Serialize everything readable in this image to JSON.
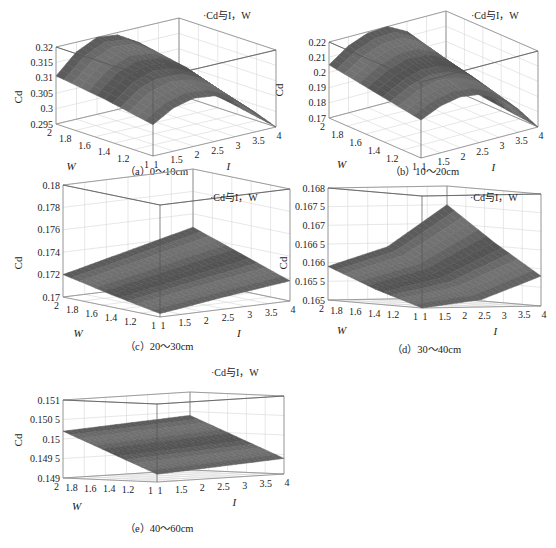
{
  "figure": {
    "background": "#ffffff",
    "surface_color": "#6e6e6e",
    "surface_edge_color": "#4a4a4a",
    "box_color": "#8a8a8a",
    "grid_color": "#d6d6d6"
  },
  "chart_data": [
    {
      "id": "a",
      "type": "surface3d",
      "caption": "（a）0～10cm",
      "legend": "·Cd与I，W",
      "xlabel": "I",
      "ylabel": "W",
      "zlabel": "Cd",
      "x_ticks": [
        "1",
        "1.5",
        "2",
        "2.5",
        "3",
        "3.5",
        "4"
      ],
      "y_ticks": [
        "1",
        "1.2",
        "1.4",
        "1.6",
        "1.8",
        "2"
      ],
      "z_ticks": [
        "0.295",
        "0.3",
        "0.305",
        "0.31",
        "0.315",
        "0.32"
      ],
      "xlim": [
        1,
        4
      ],
      "ylim": [
        1,
        2
      ],
      "zlim": [
        0.293,
        0.325
      ],
      "grid": true,
      "corners": {
        "W1I1": 0.306,
        "W2I1": 0.313,
        "W1I4": 0.293,
        "W2I4": 0.3
      },
      "peak": {
        "I": 2.2,
        "W": 2.0,
        "Cd": 0.325
      },
      "surface_grid": {
        "I": [
          1,
          1.5,
          2,
          2.5,
          3,
          3.5,
          4
        ],
        "W": [
          1,
          1.5,
          2
        ],
        "Cd": [
          [
            0.306,
            0.311,
            0.313,
            0.312,
            0.308,
            0.301,
            0.293
          ],
          [
            0.31,
            0.317,
            0.32,
            0.319,
            0.315,
            0.307,
            0.297
          ],
          [
            0.313,
            0.321,
            0.325,
            0.324,
            0.319,
            0.311,
            0.3
          ]
        ]
      }
    },
    {
      "id": "b",
      "type": "surface3d",
      "caption": "（b）10～20cm",
      "legend": "·Cd与I，W",
      "xlabel": "I",
      "ylabel": "W",
      "zlabel": "Cd",
      "x_ticks": [
        "1",
        "1.5",
        "2",
        "2.5",
        "3",
        "3.5",
        "4"
      ],
      "y_ticks": [
        "1",
        "1.2",
        "1.4",
        "1.6",
        "1.8",
        "2"
      ],
      "z_ticks": [
        "0.17",
        "0.18",
        "0.19",
        "0.2",
        "0.21",
        "0.22"
      ],
      "xlim": [
        1,
        4
      ],
      "ylim": [
        1,
        2
      ],
      "zlim": [
        0.168,
        0.228
      ],
      "grid": true,
      "corners": {
        "W1I1": 0.198,
        "W2I1": 0.21,
        "W1I4": 0.168,
        "W2I4": 0.176
      },
      "peak": {
        "I": 2.3,
        "W": 2.0,
        "Cd": 0.228
      },
      "surface_grid": {
        "I": [
          1,
          1.5,
          2,
          2.5,
          3,
          3.5,
          4
        ],
        "W": [
          1,
          1.5,
          2
        ],
        "Cd": [
          [
            0.198,
            0.205,
            0.208,
            0.206,
            0.199,
            0.186,
            0.168
          ],
          [
            0.204,
            0.213,
            0.218,
            0.217,
            0.21,
            0.196,
            0.172
          ],
          [
            0.21,
            0.221,
            0.227,
            0.228,
            0.22,
            0.202,
            0.176
          ]
        ]
      }
    },
    {
      "id": "c",
      "type": "surface3d",
      "caption": "（c）20～30cm",
      "legend": "·Cd与I，W",
      "xlabel": "I",
      "ylabel": "W",
      "zlabel": "Cd",
      "x_ticks": [
        "1",
        "1.5",
        "2",
        "2.5",
        "3",
        "3.5",
        "4"
      ],
      "y_ticks": [
        "1",
        "1.2",
        "1.4",
        "1.6",
        "1.8",
        "2"
      ],
      "z_ticks": [
        "0.17",
        "0.172",
        "0.174",
        "0.176",
        "0.178",
        "0.18"
      ],
      "xlim": [
        1,
        4
      ],
      "ylim": [
        1,
        2
      ],
      "zlim": [
        0.17,
        0.18
      ],
      "grid": true,
      "corners": {
        "W1I1": 0.1703,
        "W2I1": 0.172,
        "W1I4": 0.1718,
        "W2I4": 0.1748
      },
      "surface_grid": {
        "I": [
          1,
          2.5,
          4
        ],
        "W": [
          1,
          1.5,
          2
        ],
        "Cd": [
          [
            0.1703,
            0.1711,
            0.1718
          ],
          [
            0.1711,
            0.1722,
            0.1733
          ],
          [
            0.172,
            0.1734,
            0.1748
          ]
        ]
      }
    },
    {
      "id": "d",
      "type": "surface3d",
      "caption": "（d）30～40cm",
      "legend": "·Cd与I，W",
      "xlabel": "I",
      "ylabel": "W",
      "zlabel": "Cd",
      "x_ticks": [
        "1",
        "1.5",
        "2",
        "2.5",
        "3",
        "3.5",
        "4"
      ],
      "y_ticks": [
        "1",
        "1.2",
        "1.4",
        "1.6",
        "1.8",
        "2"
      ],
      "z_ticks": [
        "0.165",
        "0.165 5",
        "0.166",
        "0.166 5",
        "0.167",
        "0.167 5",
        "0.168"
      ],
      "xlim": [
        1,
        4
      ],
      "ylim": [
        1,
        2
      ],
      "zlim": [
        0.165,
        0.168
      ],
      "grid": true,
      "corners": {
        "W1I1": 0.165,
        "W2I1": 0.1659,
        "W1I4": 0.1658,
        "W2I4": 0.1675
      },
      "surface_grid": {
        "I": [
          1,
          2.5,
          4
        ],
        "W": [
          1,
          1.5,
          2
        ],
        "Cd": [
          [
            0.165,
            0.1652,
            0.1658
          ],
          [
            0.1654,
            0.1658,
            0.1666
          ],
          [
            0.1659,
            0.1664,
            0.1675
          ]
        ]
      }
    },
    {
      "id": "e",
      "type": "surface3d",
      "caption": "（e）40～60cm",
      "legend": "·Cd与I，W",
      "xlabel": "I",
      "ylabel": "W",
      "zlabel": "Cd",
      "x_ticks": [
        "1",
        "1.5",
        "2",
        "2.5",
        "3",
        "3.5",
        "4"
      ],
      "y_ticks": [
        "1",
        "1.2",
        "1.4",
        "1.6",
        "1.8",
        "2"
      ],
      "z_ticks": [
        "0.149",
        "0.149 5",
        "0.15",
        "0.150 5",
        "0.151"
      ],
      "xlim": [
        1,
        4
      ],
      "ylim": [
        1,
        2
      ],
      "zlim": [
        0.149,
        0.151
      ],
      "grid": true,
      "corners": {
        "W1I1": 0.1492,
        "W2I1": 0.1502,
        "W1I4": 0.1494,
        "W2I4": 0.1504
      },
      "surface_grid": {
        "I": [
          1,
          2.5,
          4
        ],
        "W": [
          1,
          1.5,
          2
        ],
        "Cd": [
          [
            0.1492,
            0.1493,
            0.1494
          ],
          [
            0.1497,
            0.1498,
            0.1499
          ],
          [
            0.1502,
            0.1503,
            0.1504
          ]
        ]
      }
    }
  ],
  "layout": {
    "panels": [
      {
        "id": "a",
        "origin": [
          0,
          0
        ],
        "frame": {
          "F": [
            153,
            156
          ],
          "L": [
            56,
            124
          ],
          "R": [
            276,
            127
          ],
          "H": 77
        },
        "zlabel_pos": [
          22,
          97
        ],
        "caption_pos": [
          125,
          170
        ],
        "legend_pos": [
          203,
          14
        ]
      },
      {
        "id": "b",
        "origin": [
          0,
          0
        ],
        "frame": {
          "F": [
            421,
            158
          ],
          "L": [
            329,
            118
          ],
          "R": [
            538,
            127
          ],
          "H": 76
        },
        "zlabel_pos": [
          283,
          90
        ],
        "caption_pos": [
          390,
          170
        ],
        "legend_pos": [
          471,
          14
        ]
      },
      {
        "id": "c",
        "origin": [
          0,
          0
        ],
        "frame": {
          "F": [
            160,
            317
          ],
          "L": [
            63,
            297
          ],
          "R": [
            290,
            301
          ],
          "H": 112
        },
        "zlabel_pos": [
          22,
          263
        ],
        "caption_pos": [
          125,
          345
        ],
        "legend_pos": [
          210,
          196
        ]
      },
      {
        "id": "d",
        "origin": [
          0,
          0
        ],
        "frame": {
          "F": [
            422,
            308
          ],
          "L": [
            328,
            300
          ],
          "R": [
            541,
            306
          ],
          "H": 112
        },
        "zlabel_pos": [
          287,
          263
        ],
        "caption_pos": [
          392,
          348
        ],
        "legend_pos": [
          470,
          196
        ]
      },
      {
        "id": "e",
        "origin": [
          0,
          0
        ],
        "frame": {
          "F": [
            157,
            482
          ],
          "L": [
            63,
            478
          ],
          "R": [
            284,
            474
          ],
          "H": 78
        },
        "zlabel_pos": [
          22,
          440
        ],
        "caption_pos": [
          125,
          527
        ],
        "legend_pos": [
          211,
          371
        ]
      }
    ]
  }
}
